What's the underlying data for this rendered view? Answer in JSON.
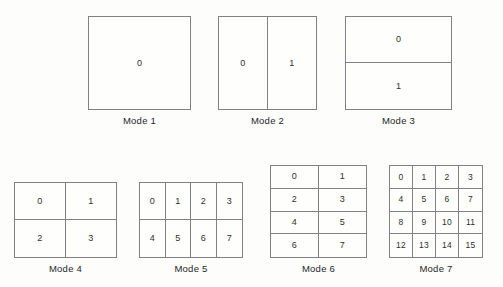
{
  "figure": {
    "title": "",
    "background_color": "#fdfdfb",
    "line_color": "#808086",
    "text_color": "#2f2f2f"
  },
  "modes": [
    {
      "id": "mode-1",
      "caption": "Mode 1",
      "columns": 1,
      "rows": 1,
      "cells": [
        "0"
      ]
    },
    {
      "id": "mode-2",
      "caption": "Mode 2",
      "columns": 2,
      "rows": 1,
      "cells": [
        "0",
        "1"
      ]
    },
    {
      "id": "mode-3",
      "caption": "Mode 3",
      "columns": 1,
      "rows": 2,
      "cells": [
        "0",
        "1"
      ]
    },
    {
      "id": "mode-4",
      "caption": "Mode 4",
      "columns": 2,
      "rows": 2,
      "cells": [
        "0",
        "1",
        "2",
        "3"
      ]
    },
    {
      "id": "mode-5",
      "caption": "Mode 5",
      "columns": 4,
      "rows": 2,
      "cells": [
        "0",
        "1",
        "2",
        "3",
        "4",
        "5",
        "6",
        "7"
      ]
    },
    {
      "id": "mode-6",
      "caption": "Mode 6",
      "columns": 2,
      "rows": 4,
      "cells": [
        "0",
        "1",
        "2",
        "3",
        "4",
        "5",
        "6",
        "7"
      ]
    },
    {
      "id": "mode-7",
      "caption": "Mode 7",
      "columns": 4,
      "rows": 4,
      "cells": [
        "0",
        "1",
        "2",
        "3",
        "4",
        "5",
        "6",
        "7",
        "8",
        "9",
        "10",
        "11",
        "12",
        "13",
        "14",
        "15"
      ]
    }
  ]
}
